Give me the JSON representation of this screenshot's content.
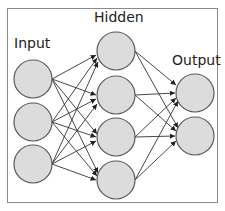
{
  "diagram": {
    "type": "neural-network",
    "frame": {
      "border_color": "#8a8a8a"
    },
    "node_fill": "#dcdcdc",
    "node_stroke": "#5a5a5a",
    "edge_color": "#333333",
    "layers": [
      {
        "label": "Input",
        "node_count": 3
      },
      {
        "label": "Hidden",
        "node_count": 4
      },
      {
        "label": "Output",
        "node_count": 2
      }
    ],
    "connections": "fully-connected with arrowheads (input→hidden, hidden→output)"
  }
}
